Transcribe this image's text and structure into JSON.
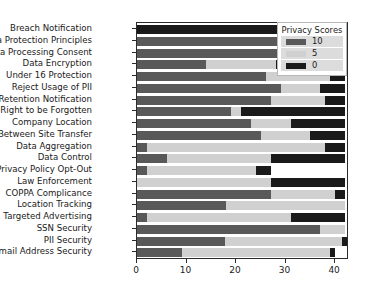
{
  "chart_data": {
    "type": "bar",
    "orientation": "horizontal",
    "stacked": true,
    "title": "",
    "xlabel": "",
    "ylabel": "",
    "xlim": [
      0,
      42.4
    ],
    "xticks": [
      0,
      10,
      20,
      30,
      40
    ],
    "xticklabels": [
      "0",
      "10",
      "20",
      "30",
      "40"
    ],
    "grid": false,
    "legend": {
      "title": "Privacy Scores",
      "position": "upper right",
      "entries": [
        {
          "label": "10",
          "color": "#595959"
        },
        {
          "label": "5",
          "color": "#d0d0d0"
        },
        {
          "label": "0",
          "color": "#1a1a1a"
        }
      ]
    },
    "categories": [
      "Breach Notification",
      "Data Protection Principles",
      "Data Processing Consent",
      "Data Encryption",
      "Under 16 Protection",
      "Reject Usage of PII",
      "Data Retention Notification",
      "Right to be Forgotten",
      "Company Location",
      "Between Site Transfer",
      "Data Aggregation",
      "Data Control",
      "Privacy Policy Opt-Out",
      "Law Enforcement",
      "COPPA Complicance",
      "Location Tracking",
      "Targeted Advertising",
      "SSN Security",
      "PII Security",
      "Email Address Security"
    ],
    "series": [
      {
        "name": "10",
        "color": "#595959",
        "values": [
          0,
          40,
          39,
          14,
          26,
          29,
          27,
          19,
          23,
          25,
          2,
          6,
          2,
          0,
          27,
          18,
          2,
          37,
          18,
          9
        ]
      },
      {
        "name": "5",
        "color": "#d0d0d0",
        "values": [
          0,
          2,
          1,
          14,
          13,
          8,
          11,
          2,
          8,
          10,
          36,
          21,
          22,
          27,
          13,
          24,
          29,
          5,
          24,
          30
        ]
      },
      {
        "name": "0",
        "color": "#1a1a1a",
        "values": [
          42,
          0,
          2,
          14,
          3,
          5,
          4,
          21,
          11,
          7,
          4,
          15,
          3,
          15,
          2,
          0,
          11,
          0,
          1,
          1
        ]
      }
    ]
  }
}
